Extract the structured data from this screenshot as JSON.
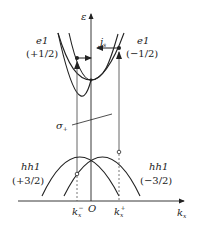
{
  "axes": {
    "y_label": "ε",
    "x_label": "k",
    "x_label_sub": "x",
    "origin_label": "O"
  },
  "bands": {
    "e1_left": {
      "name": "e1",
      "spin": "(+1/2)"
    },
    "e1_right": {
      "name": "e1",
      "spin": "(−1/2)"
    },
    "hh1_left": {
      "name": "hh1",
      "spin": "(+3/2)"
    },
    "hh1_right": {
      "name": "hh1",
      "spin": "(−3/2)"
    }
  },
  "annotations": {
    "current": "j",
    "current_sub": "s",
    "polarization": "σ",
    "polarization_sub": "+"
  },
  "ticks": {
    "k_minus": "k",
    "k_minus_sub": "x",
    "k_minus_sup": "−",
    "k_plus": "k",
    "k_plus_sub": "x",
    "k_plus_sup": "+"
  },
  "colors": {
    "line": "#222222",
    "thin_line": "#555555"
  }
}
